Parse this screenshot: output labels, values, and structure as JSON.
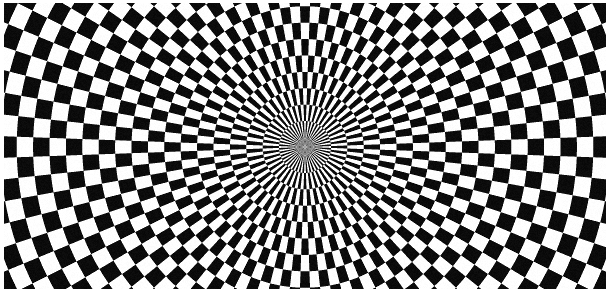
{
  "figure": {
    "width": 610,
    "height": 292
  },
  "canvas": {
    "label": "illusion-canvas",
    "background": "#ffffff"
  },
  "frame": {
    "border_color": "#ffffff",
    "border_width_px": 3,
    "inset_left_px": 4,
    "inset_right_px": 4,
    "inset_top_px": 3,
    "inset_bottom_px": 3
  },
  "chart_data": {
    "type": "heatmap",
    "xlabel": "",
    "ylabel": "",
    "pattern": "polar-checkerboard",
    "center_x": 305,
    "center_y": 147,
    "ring_period_px": 16.4,
    "ring_phase": 0.42,
    "angular_sectors": 88,
    "angular_phase": 0.5,
    "max_radius_px": 360,
    "colors": {
      "light": "#ffffff",
      "dark": "#0b0b0b",
      "gray": "#a4a4a4",
      "background": "#ffffff"
    },
    "supersample": 4,
    "gray_blend_threshold": 0.18,
    "noise_amount": 9,
    "grid": false,
    "legend": false,
    "annotations": []
  }
}
